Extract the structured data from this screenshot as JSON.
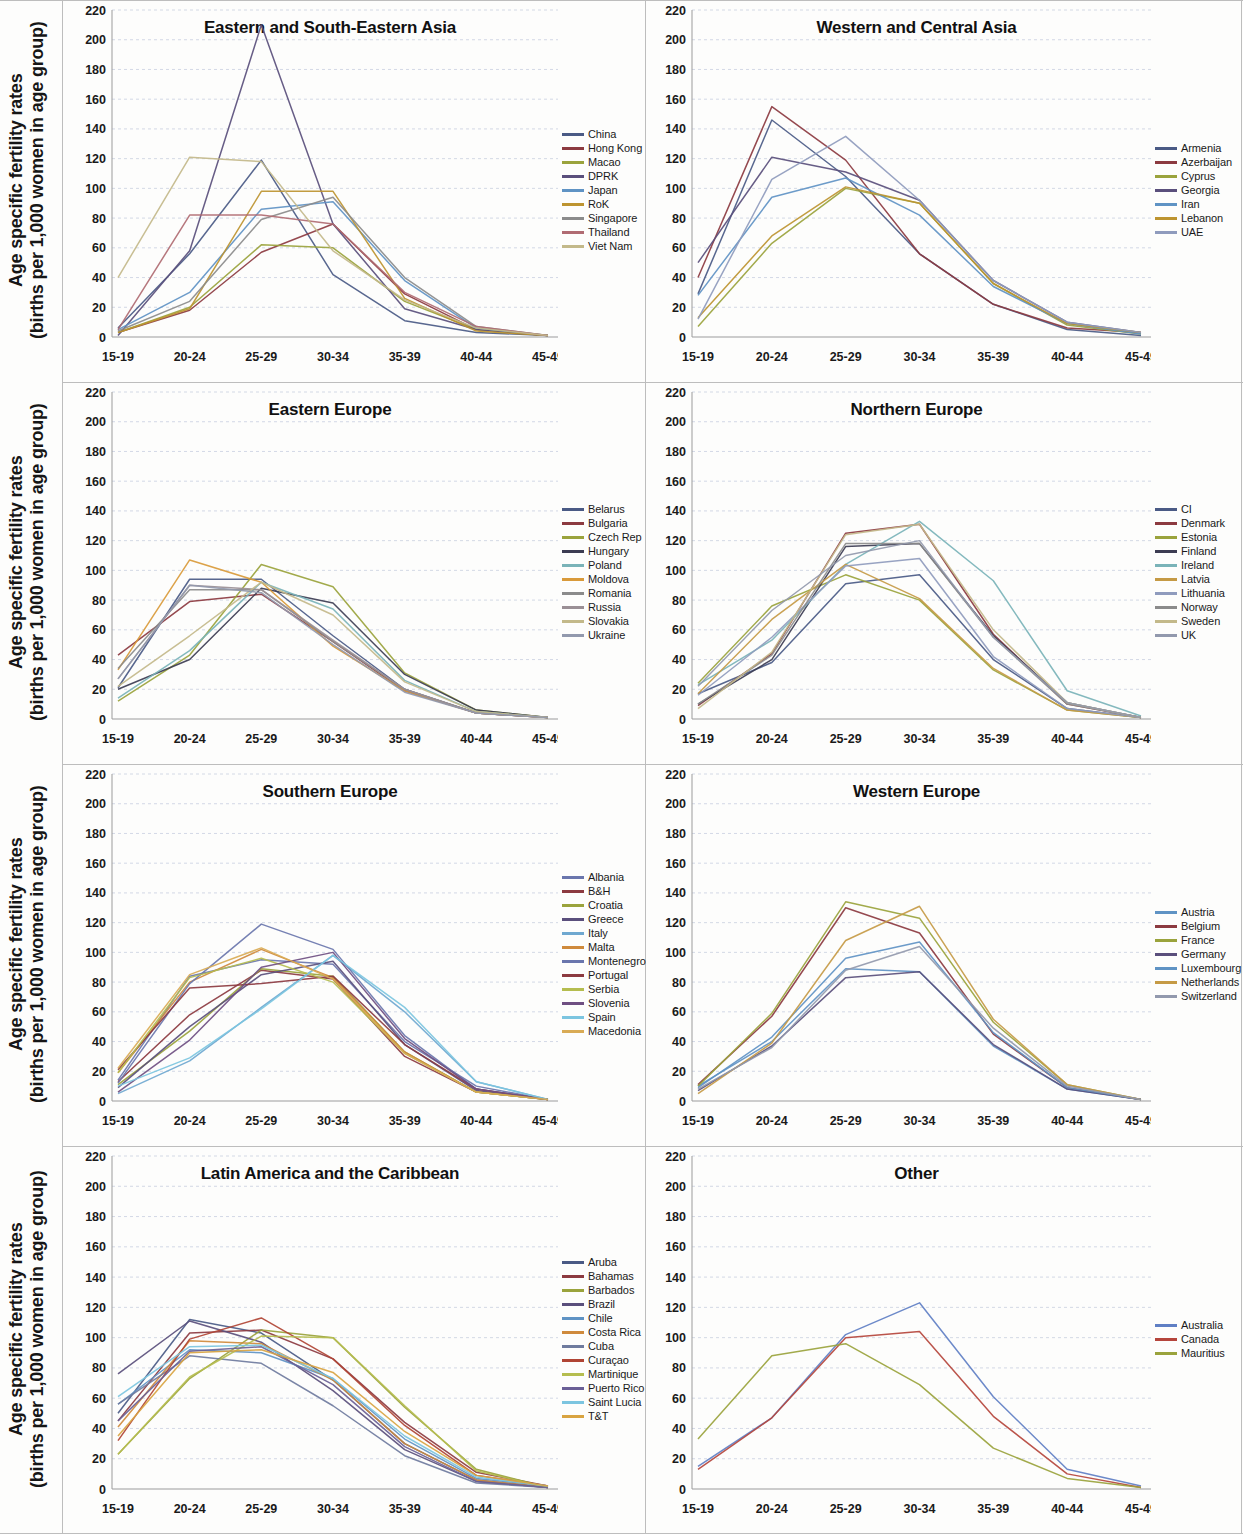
{
  "figure": {
    "y_axis_label_line1": "Age specific fertility rates",
    "y_axis_label_line2": "(births per 1,000 women in age group)",
    "categories": [
      "15-19",
      "20-24",
      "25-29",
      "30-34",
      "35-39",
      "40-44",
      "45-49"
    ],
    "y_ticks": [
      0,
      20,
      40,
      60,
      80,
      100,
      120,
      140,
      160,
      180,
      200,
      220
    ],
    "ylim": [
      0,
      220
    ],
    "palette": [
      "#4a5a85",
      "#8c3a40",
      "#9aa33c",
      "#5a4f7c",
      "#5f93c4",
      "#bd9430",
      "#8b8b8b",
      "#b06b72",
      "#c3b98a",
      "#8f9bbd",
      "#6f7b9e",
      "#d9a441"
    ]
  },
  "chart_data": [
    {
      "type": "line",
      "title": "Eastern and South-Eastern Asia",
      "xlabel": "",
      "ylabel": "Age specific fertility rates (births per 1,000 women in age group)",
      "categories": [
        "15-19",
        "20-24",
        "25-29",
        "30-34",
        "35-39",
        "40-44",
        "45-49"
      ],
      "ylim": [
        0,
        220
      ],
      "grid": true,
      "legend_position": "right",
      "series": [
        {
          "name": "China",
          "color": "#4a5a85",
          "values": [
            6,
            56,
            119,
            42,
            11,
            3,
            1
          ]
        },
        {
          "name": "Hong Kong",
          "color": "#8c3a40",
          "values": [
            3,
            18,
            57,
            76,
            29,
            5,
            1
          ]
        },
        {
          "name": "Macao",
          "color": "#9aa33c",
          "values": [
            3,
            20,
            62,
            60,
            24,
            5,
            1
          ]
        },
        {
          "name": "DPRK",
          "color": "#5a4f7c",
          "values": [
            1,
            58,
            210,
            76,
            19,
            5,
            1
          ]
        },
        {
          "name": "Japan",
          "color": "#5f93c4",
          "values": [
            5,
            30,
            86,
            91,
            38,
            6,
            1
          ]
        },
        {
          "name": "RoK",
          "color": "#bd9430",
          "values": [
            3,
            19,
            98,
            98,
            26,
            4,
            1
          ]
        },
        {
          "name": "Singapore",
          "color": "#8b8b8b",
          "values": [
            4,
            24,
            79,
            94,
            40,
            7,
            1
          ]
        },
        {
          "name": "Thailand",
          "color": "#b06b72",
          "values": [
            5,
            82,
            82,
            76,
            30,
            7,
            1
          ]
        },
        {
          "name": "Viet Nam",
          "color": "#c3b98a",
          "values": [
            40,
            121,
            118,
            58,
            25,
            6,
            1
          ]
        }
      ]
    },
    {
      "type": "line",
      "title": "Western and Central Asia",
      "xlabel": "",
      "ylabel": "",
      "categories": [
        "15-19",
        "20-24",
        "25-29",
        "30-34",
        "35-39",
        "40-44",
        "45-49"
      ],
      "ylim": [
        0,
        220
      ],
      "grid": true,
      "legend_position": "right",
      "series": [
        {
          "name": "Armenia",
          "color": "#4a5a85",
          "values": [
            29,
            146,
            108,
            56,
            22,
            5,
            1
          ]
        },
        {
          "name": "Azerbaijan",
          "color": "#8c3a40",
          "values": [
            40,
            155,
            119,
            56,
            22,
            6,
            3
          ]
        },
        {
          "name": "Cyprus",
          "color": "#9aa33c",
          "values": [
            7,
            63,
            100,
            90,
            36,
            8,
            2
          ]
        },
        {
          "name": "Georgia",
          "color": "#5a4f7c",
          "values": [
            50,
            121,
            111,
            92,
            38,
            10,
            3
          ]
        },
        {
          "name": "Iran",
          "color": "#5f93c4",
          "values": [
            28,
            94,
            107,
            82,
            34,
            9,
            2
          ]
        },
        {
          "name": "Lebanon",
          "color": "#bd9430",
          "values": [
            13,
            68,
            101,
            90,
            36,
            9,
            3
          ]
        },
        {
          "name": "UAE",
          "color": "#8f9bbd",
          "values": [
            12,
            106,
            135,
            92,
            38,
            10,
            3
          ]
        }
      ]
    },
    {
      "type": "line",
      "title": "Eastern Europe",
      "xlabel": "",
      "ylabel": "Age specific fertility rates (births per 1,000 women in age group)",
      "categories": [
        "15-19",
        "20-24",
        "25-29",
        "30-34",
        "35-39",
        "40-44",
        "45-49"
      ],
      "ylim": [
        0,
        220
      ],
      "grid": true,
      "legend_position": "right",
      "series": [
        {
          "name": "Belarus",
          "color": "#4a5a85",
          "values": [
            21,
            94,
            94,
            56,
            20,
            4,
            1
          ]
        },
        {
          "name": "Bulgaria",
          "color": "#8c3a40",
          "values": [
            43,
            79,
            84,
            52,
            19,
            4,
            1
          ]
        },
        {
          "name": "Czech Rep",
          "color": "#9aa33c",
          "values": [
            12,
            43,
            104,
            89,
            31,
            6,
            1
          ]
        },
        {
          "name": "Hungary",
          "color": "#3c3c52",
          "values": [
            20,
            40,
            88,
            78,
            30,
            6,
            1
          ]
        },
        {
          "name": "Poland",
          "color": "#7ab3b8",
          "values": [
            14,
            46,
            92,
            74,
            26,
            5,
            1
          ]
        },
        {
          "name": "Moldova",
          "color": "#d99a3a",
          "values": [
            33,
            107,
            92,
            49,
            19,
            4,
            1
          ]
        },
        {
          "name": "Romania",
          "color": "#8b8b8b",
          "values": [
            34,
            87,
            87,
            52,
            20,
            4,
            1
          ]
        },
        {
          "name": "Russia",
          "color": "#9a8f95",
          "values": [
            27,
            90,
            87,
            53,
            20,
            4,
            1
          ]
        },
        {
          "name": "Slovakia",
          "color": "#c3b98a",
          "values": [
            22,
            56,
            92,
            70,
            25,
            5,
            1
          ]
        },
        {
          "name": "Ukraine",
          "color": "#9299ad",
          "values": [
            27,
            90,
            85,
            50,
            18,
            4,
            1
          ]
        }
      ]
    },
    {
      "type": "line",
      "title": "Northern Europe",
      "xlabel": "",
      "ylabel": "",
      "categories": [
        "15-19",
        "20-24",
        "25-29",
        "30-34",
        "35-39",
        "40-44",
        "45-49"
      ],
      "ylim": [
        0,
        220
      ],
      "grid": true,
      "legend_position": "right",
      "series": [
        {
          "name": "CI",
          "color": "#4a5a85",
          "values": [
            17,
            38,
            91,
            97,
            40,
            7,
            1
          ]
        },
        {
          "name": "Denmark",
          "color": "#8c3a40",
          "values": [
            9,
            44,
            125,
            131,
            57,
            10,
            1
          ]
        },
        {
          "name": "Estonia",
          "color": "#9aa33c",
          "values": [
            24,
            76,
            97,
            80,
            33,
            6,
            1
          ]
        },
        {
          "name": "Finland",
          "color": "#3c3c52",
          "values": [
            10,
            40,
            116,
            118,
            56,
            11,
            1
          ]
        },
        {
          "name": "Ireland",
          "color": "#7ab3b8",
          "values": [
            23,
            53,
            104,
            133,
            93,
            19,
            2
          ]
        },
        {
          "name": "Latvia",
          "color": "#c59a45",
          "values": [
            17,
            67,
            104,
            81,
            34,
            6,
            1
          ]
        },
        {
          "name": "Lithuania",
          "color": "#8f9bbd",
          "values": [
            16,
            55,
            103,
            108,
            42,
            7,
            1
          ]
        },
        {
          "name": "Norway",
          "color": "#8b8b8b",
          "values": [
            10,
            43,
            118,
            118,
            55,
            10,
            1
          ]
        },
        {
          "name": "Sweden",
          "color": "#c3b98a",
          "values": [
            7,
            45,
            124,
            131,
            60,
            11,
            1
          ]
        },
        {
          "name": "UK",
          "color": "#9299ad",
          "values": [
            22,
            73,
            110,
            120,
            55,
            11,
            1
          ]
        }
      ]
    },
    {
      "type": "line",
      "title": "Southern Europe",
      "xlabel": "",
      "ylabel": "Age specific fertility rates (births per 1,000 women in age group)",
      "categories": [
        "15-19",
        "20-24",
        "25-29",
        "30-34",
        "35-39",
        "40-44",
        "45-49"
      ],
      "ylim": [
        0,
        220
      ],
      "grid": true,
      "legend_position": "right",
      "series": [
        {
          "name": "Albania",
          "color": "#6a76ad",
          "values": [
            14,
            84,
            95,
            92,
            40,
            10,
            1
          ]
        },
        {
          "name": "B&H",
          "color": "#8c3a40",
          "values": [
            13,
            58,
            88,
            82,
            30,
            6,
            1
          ]
        },
        {
          "name": "Croatia",
          "color": "#9aa33c",
          "values": [
            11,
            47,
            89,
            84,
            33,
            6,
            1
          ]
        },
        {
          "name": "Greece",
          "color": "#5a4f7c",
          "values": [
            9,
            50,
            85,
            94,
            38,
            7,
            1
          ]
        },
        {
          "name": "Italy",
          "color": "#6fa8d0",
          "values": [
            5,
            27,
            63,
            98,
            60,
            13,
            1
          ]
        },
        {
          "name": "Malta",
          "color": "#cf8a3c",
          "values": [
            19,
            80,
            102,
            83,
            33,
            6,
            1
          ]
        },
        {
          "name": "Montenegro",
          "color": "#6a76ad",
          "values": [
            12,
            79,
            119,
            102,
            44,
            8,
            1
          ]
        },
        {
          "name": "Portugal",
          "color": "#8c3a40",
          "values": [
            21,
            76,
            79,
            84,
            38,
            8,
            1
          ]
        },
        {
          "name": "Serbia",
          "color": "#b5bd4f",
          "values": [
            19,
            83,
            96,
            80,
            32,
            6,
            1
          ]
        },
        {
          "name": "Slovenia",
          "color": "#6f4f82",
          "values": [
            6,
            41,
            90,
            100,
            42,
            8,
            1
          ]
        },
        {
          "name": "Spain",
          "color": "#7cc5e0",
          "values": [
            10,
            29,
            62,
            98,
            63,
            13,
            1
          ]
        },
        {
          "name": "Macedonia",
          "color": "#d9ab55",
          "values": [
            22,
            85,
            103,
            82,
            32,
            6,
            1
          ]
        }
      ]
    },
    {
      "type": "line",
      "title": "Western Europe",
      "xlabel": "",
      "ylabel": "",
      "categories": [
        "15-19",
        "20-24",
        "25-29",
        "30-34",
        "35-39",
        "40-44",
        "45-49"
      ],
      "ylim": [
        0,
        220
      ],
      "grid": true,
      "legend_position": "right",
      "series": [
        {
          "name": "Austria",
          "color": "#5f93c4",
          "values": [
            10,
            40,
            89,
            87,
            37,
            8,
            1
          ]
        },
        {
          "name": "Belgium",
          "color": "#8c3a40",
          "values": [
            11,
            57,
            130,
            113,
            45,
            9,
            1
          ]
        },
        {
          "name": "France",
          "color": "#9aa33c",
          "values": [
            10,
            59,
            134,
            123,
            53,
            11,
            1
          ]
        },
        {
          "name": "Germany",
          "color": "#5a4f7c",
          "values": [
            7,
            37,
            83,
            87,
            38,
            8,
            1
          ]
        },
        {
          "name": "Luxembourg",
          "color": "#5f93c4",
          "values": [
            9,
            43,
            96,
            107,
            46,
            9,
            1
          ]
        },
        {
          "name": "Netherlands",
          "color": "#c59a45",
          "values": [
            5,
            39,
            108,
            131,
            55,
            11,
            1
          ]
        },
        {
          "name": "Switzerland",
          "color": "#9299ad",
          "values": [
            8,
            36,
            88,
            104,
            49,
            10,
            1
          ]
        }
      ]
    },
    {
      "type": "line",
      "title": "Latin America and the Caribbean",
      "xlabel": "",
      "ylabel": "Age specific fertility rates (births per 1,000 women in age group)",
      "categories": [
        "15-19",
        "20-24",
        "25-29",
        "30-34",
        "35-39",
        "40-44",
        "45-49"
      ],
      "ylim": [
        0,
        220
      ],
      "grid": true,
      "legend_position": "right",
      "series": [
        {
          "name": "Aruba",
          "color": "#4a5a85",
          "values": [
            50,
            112,
            103,
            72,
            30,
            6,
            1
          ]
        },
        {
          "name": "Bahamas",
          "color": "#8c3a40",
          "values": [
            45,
            103,
            105,
            86,
            44,
            11,
            2
          ]
        },
        {
          "name": "Barbados",
          "color": "#9aa33c",
          "values": [
            23,
            73,
            105,
            100,
            54,
            13,
            1
          ]
        },
        {
          "name": "Brazil",
          "color": "#5a4f7c",
          "values": [
            76,
            111,
            97,
            65,
            26,
            5,
            1
          ]
        },
        {
          "name": "Chile",
          "color": "#5f93c4",
          "values": [
            56,
            92,
            90,
            73,
            33,
            7,
            2
          ]
        },
        {
          "name": "Costa Rica",
          "color": "#cf8a3c",
          "values": [
            41,
            98,
            96,
            72,
            30,
            6,
            1
          ]
        },
        {
          "name": "Cuba",
          "color": "#6f7b9e",
          "values": [
            56,
            88,
            83,
            55,
            22,
            4,
            1
          ]
        },
        {
          "name": "Curaçao",
          "color": "#b04434",
          "values": [
            32,
            99,
            113,
            86,
            42,
            9,
            2
          ]
        },
        {
          "name": "Martinique",
          "color": "#b5bd4f",
          "values": [
            23,
            74,
            101,
            100,
            55,
            12,
            1
          ]
        },
        {
          "name": "Puerto Rico",
          "color": "#6a5f96",
          "values": [
            45,
            91,
            94,
            69,
            28,
            5,
            1
          ]
        },
        {
          "name": "Saint Lucia",
          "color": "#7cc5e0",
          "values": [
            61,
            94,
            95,
            73,
            35,
            8,
            2
          ]
        },
        {
          "name": "T&T",
          "color": "#d9a441",
          "values": [
            35,
            90,
            92,
            77,
            38,
            9,
            2
          ]
        }
      ]
    },
    {
      "type": "line",
      "title": "Other",
      "xlabel": "",
      "ylabel": "",
      "categories": [
        "15-19",
        "20-24",
        "25-29",
        "30-34",
        "35-39",
        "40-44",
        "45-49"
      ],
      "ylim": [
        0,
        220
      ],
      "grid": true,
      "legend_position": "right",
      "series": [
        {
          "name": "Australia",
          "color": "#5f7fc4",
          "values": [
            15,
            47,
            102,
            123,
            61,
            13,
            2
          ]
        },
        {
          "name": "Canada",
          "color": "#b5453c",
          "values": [
            13,
            47,
            100,
            104,
            48,
            10,
            1
          ]
        },
        {
          "name": "Mauritius",
          "color": "#9aa33c",
          "values": [
            33,
            88,
            96,
            69,
            27,
            7,
            1
          ]
        }
      ]
    }
  ]
}
